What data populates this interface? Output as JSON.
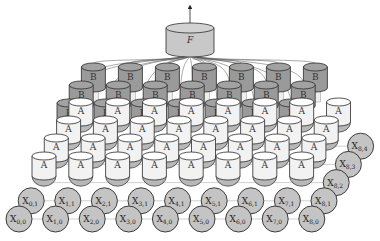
{
  "diagram": {
    "type": "grid-recurrent-network",
    "output_node": {
      "label": "F",
      "italic": true,
      "cx": 190,
      "top": 28,
      "rx": 24,
      "ry": 5,
      "height": 24,
      "fill": "#c8c8c8"
    },
    "output_arrow": {
      "from_y": 28,
      "to_y": 3
    },
    "input_grid": {
      "cols": 9,
      "rows": 5,
      "label_prefix": "X",
      "origin": {
        "x": 19,
        "y": 219
      },
      "col_step": {
        "dx": 36.6,
        "dy": 0
      },
      "row_step": {
        "dx": 12.2,
        "dy": -18.2
      },
      "radius": 13,
      "fill": "#c4c4c4",
      "visible_labels": [
        "X0,0",
        "X1,0",
        "X2,0",
        "X3,0",
        "X4,0",
        "X5,0",
        "X6,0",
        "X7,0",
        "X8,0",
        "X0,1",
        "X1,1",
        "X2,1",
        "X3,1",
        "X4,1",
        "X5,1",
        "X6,1",
        "X7,1",
        "X8,1",
        "X8,2",
        "X8,3",
        "X8,4"
      ]
    },
    "a_layer": {
      "label": "A",
      "rows": 4,
      "cols": 8,
      "origin": {
        "x": 44,
        "y": 156
      },
      "col_step": {
        "dx": 36.8,
        "dy": 0
      },
      "row_step": {
        "dx": 12.3,
        "dy": -18
      },
      "rx": 12,
      "ry": 4,
      "height": 20,
      "fill": "#f2f2f2",
      "half_disc_fill": "#b8b8b8"
    },
    "b_layer": {
      "label": "B",
      "rows": 3,
      "cols": 7,
      "origin": {
        "x": 69,
        "y": 103
      },
      "col_step": {
        "dx": 37,
        "dy": 0
      },
      "row_step": {
        "dx": 12.2,
        "dy": -18
      },
      "rx": 12,
      "ry": 4,
      "height": 21,
      "fill": "#9a9a9a"
    },
    "stroke": "#2a2a2a",
    "edge_color": "#555555"
  }
}
